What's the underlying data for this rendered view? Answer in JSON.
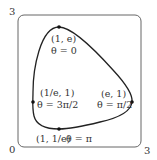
{
  "diagram": {
    "type": "parametric-curve-plot",
    "axes": {
      "x_min_label": "0",
      "x_max_label": "3",
      "y_max_label": "3"
    },
    "points": [
      {
        "coord": "(1, e)",
        "theta": "θ = 0"
      },
      {
        "coord": "(e, 1)",
        "theta": "θ = π/2"
      },
      {
        "coord": "(1, 1/e)",
        "theta": "θ = π"
      },
      {
        "coord": "(1/e, 1)",
        "theta": "θ = 3π/2"
      }
    ],
    "colors": {
      "curve": "#222222",
      "frame": "#666666",
      "text": "#333333"
    }
  }
}
